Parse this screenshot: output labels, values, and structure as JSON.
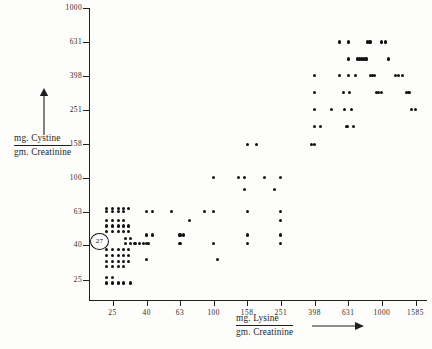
{
  "figure": {
    "background": "#fdfdfc",
    "ink_color": "#111111"
  },
  "annotation": {
    "circled_value": "27",
    "name": "circled-data-annotation"
  },
  "chart_data": {
    "type": "scatter",
    "title": "",
    "xlabel": "mg.Lysine / gm.Creatinine",
    "ylabel": "mg.Cystine / gm.Creatinine",
    "xlabel_numerator": "mg. Lysine",
    "xlabel_denominator": "gm. Creatinine",
    "ylabel_numerator": "mg. Cystine",
    "ylabel_denominator": "gm. Creatinine",
    "xscale": "log",
    "yscale": "log",
    "grid": false,
    "legend": null,
    "xticks": [
      25,
      40,
      63,
      100,
      158,
      251,
      398,
      631,
      1000,
      1585
    ],
    "xtick_labels": [
      "25",
      "40",
      "63",
      "100",
      "158",
      "251",
      "398",
      "631",
      "1000",
      "1585"
    ],
    "yticks": [
      25,
      40,
      63,
      100,
      158,
      251,
      398,
      631,
      1000
    ],
    "ytick_labels": [
      "25",
      "40",
      "63",
      "100",
      "158",
      "251",
      "398",
      "631",
      "1000"
    ],
    "xlim": [
      19.8,
      2000
    ],
    "ylim": [
      19.8,
      1000
    ],
    "points": [
      [
        23,
        66
      ],
      [
        25,
        66
      ],
      [
        27,
        66
      ],
      [
        29,
        66
      ],
      [
        31,
        66
      ],
      [
        23,
        63
      ],
      [
        25,
        63
      ],
      [
        27,
        63
      ],
      [
        29,
        63
      ],
      [
        23,
        56
      ],
      [
        25,
        56
      ],
      [
        27,
        56
      ],
      [
        29,
        56
      ],
      [
        23,
        52
      ],
      [
        25,
        52
      ],
      [
        27,
        52
      ],
      [
        29,
        52
      ],
      [
        31,
        52
      ],
      [
        23,
        48
      ],
      [
        25,
        48
      ],
      [
        27,
        48
      ],
      [
        29,
        48
      ],
      [
        31,
        48
      ],
      [
        30,
        44
      ],
      [
        32,
        44
      ],
      [
        30,
        41
      ],
      [
        32,
        41
      ],
      [
        34,
        41
      ],
      [
        36,
        41
      ],
      [
        38,
        41
      ],
      [
        41,
        41
      ],
      [
        23,
        38
      ],
      [
        25,
        38
      ],
      [
        27,
        38
      ],
      [
        29,
        38
      ],
      [
        31,
        38
      ],
      [
        23,
        35
      ],
      [
        25,
        35
      ],
      [
        27,
        35
      ],
      [
        29,
        35
      ],
      [
        31,
        35
      ],
      [
        23,
        32
      ],
      [
        25,
        32
      ],
      [
        27,
        32
      ],
      [
        29,
        32
      ],
      [
        31,
        32
      ],
      [
        23,
        30
      ],
      [
        25,
        30
      ],
      [
        27,
        30
      ],
      [
        29,
        30
      ],
      [
        23,
        26
      ],
      [
        25,
        26
      ],
      [
        23,
        24
      ],
      [
        25,
        24
      ],
      [
        27,
        24
      ],
      [
        29,
        24
      ],
      [
        32,
        24
      ],
      [
        40,
        63
      ],
      [
        43,
        63
      ],
      [
        40,
        46
      ],
      [
        43,
        46
      ],
      [
        40,
        41
      ],
      [
        40,
        33
      ],
      [
        56,
        63
      ],
      [
        63,
        46
      ],
      [
        66,
        46
      ],
      [
        63,
        41
      ],
      [
        72,
        56
      ],
      [
        88,
        63
      ],
      [
        100,
        100
      ],
      [
        100,
        63
      ],
      [
        100,
        41
      ],
      [
        105,
        33
      ],
      [
        140,
        100
      ],
      [
        152,
        100
      ],
      [
        152,
        85
      ],
      [
        158,
        63
      ],
      [
        158,
        46
      ],
      [
        158,
        41
      ],
      [
        158,
        158
      ],
      [
        180,
        158
      ],
      [
        200,
        100
      ],
      [
        230,
        85
      ],
      [
        251,
        100
      ],
      [
        251,
        63
      ],
      [
        251,
        46
      ],
      [
        251,
        41
      ],
      [
        251,
        56
      ],
      [
        380,
        158
      ],
      [
        398,
        398
      ],
      [
        398,
        316
      ],
      [
        398,
        251
      ],
      [
        398,
        200
      ],
      [
        398,
        158
      ],
      [
        430,
        200
      ],
      [
        500,
        251
      ],
      [
        560,
        631
      ],
      [
        560,
        398
      ],
      [
        590,
        316
      ],
      [
        600,
        251
      ],
      [
        620,
        200
      ],
      [
        631,
        631
      ],
      [
        631,
        501
      ],
      [
        631,
        398
      ],
      [
        640,
        316
      ],
      [
        660,
        251
      ],
      [
        680,
        200
      ],
      [
        700,
        398
      ],
      [
        720,
        501
      ],
      [
        740,
        501
      ],
      [
        760,
        501
      ],
      [
        780,
        501
      ],
      [
        800,
        501
      ],
      [
        810,
        501
      ],
      [
        820,
        631
      ],
      [
        850,
        631
      ],
      [
        860,
        398
      ],
      [
        880,
        398
      ],
      [
        900,
        398
      ],
      [
        930,
        316
      ],
      [
        960,
        316
      ],
      [
        990,
        316
      ],
      [
        1000,
        631
      ],
      [
        1050,
        631
      ],
      [
        1100,
        501
      ],
      [
        1200,
        398
      ],
      [
        1260,
        398
      ],
      [
        1320,
        398
      ],
      [
        1400,
        316
      ],
      [
        1450,
        316
      ],
      [
        1500,
        251
      ],
      [
        1585,
        251
      ]
    ]
  }
}
